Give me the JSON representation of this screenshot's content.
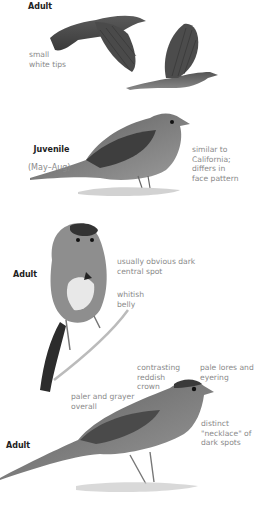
{
  "plate": {
    "section1": {
      "heading": "Adult",
      "labels": {
        "tail_tips": "small\nwhite tips"
      }
    },
    "section2": {
      "heading": "Juvenile",
      "subheading": "(May–Aug)",
      "labels": {
        "comparison": "similar to\nCalifornia;\ndiffers in\nface pattern"
      }
    },
    "section3": {
      "heading": "Adult",
      "labels": {
        "central_spot": "usually obvious dark\ncentral spot",
        "belly": "whitish\nbelly"
      }
    },
    "section4": {
      "heading": "Adult",
      "labels": {
        "crown": "contrasting\nreddish\ncrown",
        "lores": "pale lores and\neyering",
        "overall": "paler and grayer\noverall",
        "necklace": "distinct\n\"necklace\" of\ndark spots"
      }
    }
  },
  "colors": {
    "label_text": "#8a8a8a",
    "heading_text": "#222222",
    "bird_dark": "#3a3a3a",
    "bird_mid": "#6e6e6e",
    "bird_light": "#b8b8b8"
  }
}
